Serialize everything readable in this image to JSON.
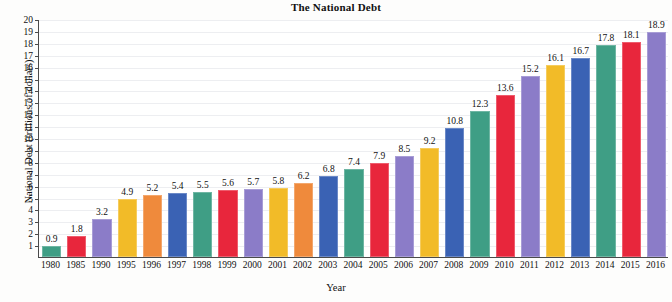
{
  "chart_data": {
    "type": "bar",
    "title": "The National Debt",
    "xlabel": "Year",
    "ylabel": "National Debt (trillions of dollars)",
    "categories": [
      "1980",
      "1985",
      "1990",
      "1995",
      "1996",
      "1997",
      "1998",
      "1999",
      "2000",
      "2001",
      "2002",
      "2003",
      "2004",
      "2005",
      "2006",
      "2007",
      "2008",
      "2009",
      "2010",
      "2011",
      "2012",
      "2013",
      "2014",
      "2015",
      "2016"
    ],
    "values": [
      0.9,
      1.8,
      3.2,
      4.9,
      5.2,
      5.4,
      5.5,
      5.6,
      5.7,
      5.8,
      6.2,
      6.8,
      7.4,
      7.9,
      8.5,
      9.2,
      10.8,
      12.3,
      13.6,
      15.2,
      16.1,
      16.7,
      17.8,
      18.1,
      18.9
    ],
    "bar_colors": [
      "#3f9e85",
      "#e8263c",
      "#8b7cc8",
      "#f2bb28",
      "#ef8a3c",
      "#3a62b4",
      "#3f9e85",
      "#e8263c",
      "#8b7cc8",
      "#f2bb28",
      "#ef8a3c",
      "#3a62b4",
      "#3f9e85",
      "#e8263c",
      "#8b7cc8",
      "#f2bb28",
      "#3a62b4",
      "#3f9e85",
      "#e8263c",
      "#8b7cc8",
      "#f2bb28",
      "#3a62b4",
      "#3f9e85",
      "#e8263c",
      "#8b7cc8"
    ],
    "ylim": [
      0,
      20
    ],
    "yticks": [
      1,
      2,
      3,
      4,
      5,
      6,
      7,
      8,
      9,
      10,
      11,
      12,
      13,
      14,
      15,
      16,
      17,
      18,
      19,
      20
    ],
    "grid": true,
    "legend": "none"
  }
}
